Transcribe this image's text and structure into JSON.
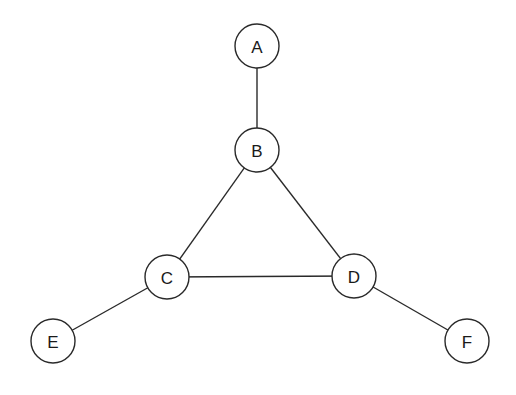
{
  "diagram": {
    "type": "undirected-graph",
    "nodes": [
      {
        "id": "A",
        "label": "A",
        "x": 257,
        "y": 46
      },
      {
        "id": "B",
        "label": "B",
        "x": 257,
        "y": 150
      },
      {
        "id": "C",
        "label": "C",
        "x": 167,
        "y": 277
      },
      {
        "id": "D",
        "label": "D",
        "x": 354,
        "y": 276
      },
      {
        "id": "E",
        "label": "E",
        "x": 53,
        "y": 341
      },
      {
        "id": "F",
        "label": "F",
        "x": 467,
        "y": 341
      }
    ],
    "edges": [
      {
        "from": "A",
        "to": "B"
      },
      {
        "from": "B",
        "to": "C"
      },
      {
        "from": "B",
        "to": "D"
      },
      {
        "from": "C",
        "to": "D"
      },
      {
        "from": "C",
        "to": "E"
      },
      {
        "from": "D",
        "to": "F"
      }
    ],
    "node_radius": 22,
    "colors": {
      "stroke": "#2a2a2a",
      "fill": "#ffffff",
      "text": "#1a1a1a"
    }
  }
}
